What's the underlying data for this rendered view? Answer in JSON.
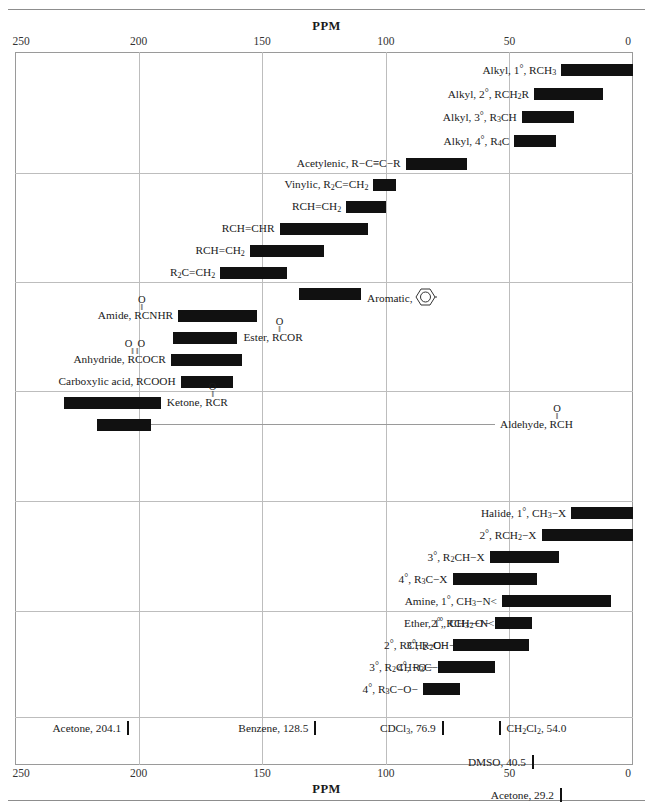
{
  "axis": {
    "title": "PPM",
    "ticks": [
      250,
      200,
      150,
      100,
      50,
      0
    ],
    "min_ppm": 0,
    "max_ppm": 250
  },
  "chart_data": {
    "type": "bar",
    "title": "PPM",
    "xlabel": "PPM",
    "ylabel": "",
    "xlim": [
      250,
      0
    ],
    "grid": true,
    "orientation": "horizontal-range",
    "note": "Carbon-13 NMR chemical shift range chart; each bar is a ppm range (start,end)",
    "groups": [
      {
        "name": "alkyl-acetylenic",
        "rows": [
          {
            "label": "Alkyl, 1°, RCH3",
            "range": [
              0,
              29
            ],
            "label_side": "right"
          },
          {
            "label": "Alkyl, 2°, RCH2R",
            "range": [
              12,
              40
            ],
            "label_side": "right"
          },
          {
            "label": "Alkyl, 3°, R3CH",
            "range": [
              24,
              45
            ],
            "label_side": "right"
          },
          {
            "label": "Alkyl, 4°, R4C",
            "range": [
              31,
              48
            ],
            "label_side": "right"
          },
          {
            "label": "Acetylenic, R−C≡C−R",
            "range": [
              67,
              92
            ],
            "label_side": "right"
          }
        ]
      },
      {
        "name": "vinylic",
        "rows": [
          {
            "label": "Vinylic, R2C=CH2",
            "range": [
              96,
              105
            ],
            "label_side": "right"
          },
          {
            "label": "RCH=CH2",
            "range": [
              100,
              116
            ],
            "label_side": "right"
          },
          {
            "label": "RCH=CHR",
            "range": [
              107,
              143
            ],
            "label_side": "right"
          },
          {
            "label": "RCH=CH2",
            "range": [
              125,
              155
            ],
            "label_side": "right"
          },
          {
            "label": "R2C=CH2",
            "range": [
              140,
              167
            ],
            "label_side": "right"
          }
        ]
      },
      {
        "name": "aromatic-carbonyl",
        "rows": [
          {
            "label": "Aromatic,",
            "range": [
              110,
              135
            ],
            "label_side": "left",
            "ring": true
          },
          {
            "label": "Amide, RCNHR",
            "range": [
              152,
              184
            ],
            "label_side": "right",
            "carbonyl": "single"
          },
          {
            "label": "Ester, RCOR",
            "range": [
              160,
              186
            ],
            "label_side": "left",
            "carbonyl": "single"
          },
          {
            "label": "Anhydride, RCOCR",
            "range": [
              158,
              187
            ],
            "label_side": "right",
            "carbonyl": "double"
          },
          {
            "label": "Carboxylic acid, RCOOH",
            "range": [
              162,
              183
            ],
            "label_side": "right"
          }
        ]
      },
      {
        "name": "ketone-aldehyde",
        "rows": [
          {
            "label": "Ketone, RCR",
            "range": [
              191,
              230
            ],
            "label_side": "left",
            "carbonyl": "single"
          },
          {
            "label": "Aldehyde, RCH",
            "range": [
              195,
              217
            ],
            "label_side": "left",
            "carbonyl": "single",
            "leader": true
          }
        ]
      },
      {
        "name": "halide-amine",
        "rows": [
          {
            "label": "Halide, 1°, CH3−X",
            "range": [
              0,
              25
            ],
            "label_side": "right"
          },
          {
            "label": "2°, RCH2−X",
            "range": [
              0,
              37
            ],
            "label_side": "right"
          },
          {
            "label": "3°, R2CH−X",
            "range": [
              30,
              58
            ],
            "label_side": "right"
          },
          {
            "label": "4°, R3C−X",
            "range": [
              39,
              73
            ],
            "label_side": "right"
          },
          {
            "label": "Amine, 1°, CH3−N<",
            "range": [
              9,
              53
            ],
            "label_side": "right"
          },
          {
            "label": "2°, RCH2−N<",
            "range": [
              42,
              54
            ],
            "label_side": "right"
          },
          {
            "label": "3°, R2CH−N<",
            "range": [
              50,
              64
            ],
            "label_side": "right"
          },
          {
            "label": "4°, R3C−N<",
            "range": [
              56,
              71
            ],
            "label_side": "right"
          }
        ]
      },
      {
        "name": "ether",
        "rows": [
          {
            "label": "Ether, 1°, CH3−O−",
            "range": [
              41,
              56
            ],
            "label_side": "right"
          },
          {
            "label": "2°, RCH2−O−",
            "range": [
              42,
              73
            ],
            "label_side": "right"
          },
          {
            "label": "3°, R2CH−O−",
            "range": [
              62,
              79
            ],
            "label_side": "right"
          },
          {
            "label": "4°, R3C−O−",
            "range": [
              70,
              85
            ],
            "label_side": "right"
          }
        ]
      }
    ],
    "solvent_markers": [
      {
        "label": "Acetone, 204.1",
        "ppm": 204.1,
        "tick_side": "right",
        "line": 1
      },
      {
        "label": "Benzene, 128.5",
        "ppm": 128.5,
        "tick_side": "right",
        "line": 1
      },
      {
        "label": "CDCl3, 76.9",
        "ppm": 76.9,
        "tick_side": "right",
        "line": 1
      },
      {
        "label": "CH2Cl2, 54.0",
        "ppm": 54.0,
        "tick_side": "left",
        "line": 1
      },
      {
        "label": "DMSO, 40.5",
        "ppm": 40.5,
        "tick_side": "right",
        "line": 2
      },
      {
        "label": "Acetone, 29.2",
        "ppm": 29.2,
        "tick_side": "right",
        "line": 3
      }
    ]
  }
}
